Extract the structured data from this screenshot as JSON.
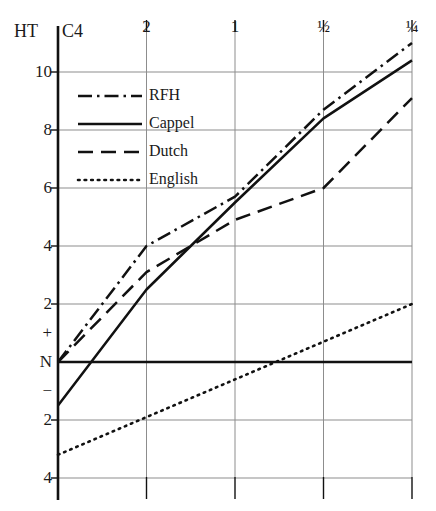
{
  "axes": {
    "y_axis_corner_label": "HT",
    "x_axis_corner_label": "C4",
    "y_ticks": [
      "10",
      "8",
      "6",
      "4",
      "2",
      "+",
      "N",
      "−",
      "2",
      "4"
    ],
    "x_ticks": [
      "2",
      "1",
      "½",
      "¼"
    ],
    "baseline_label": "N"
  },
  "legend": {
    "items": [
      {
        "label": "RFH",
        "style": "dashdot",
        "color": "#111111"
      },
      {
        "label": "Cappel",
        "style": "solid",
        "color": "#111111"
      },
      {
        "label": "Dutch",
        "style": "dashed",
        "color": "#111111"
      },
      {
        "label": "English",
        "style": "dotted",
        "color": "#111111"
      }
    ]
  },
  "chart_data": {
    "type": "line",
    "title": "",
    "subtitle": "",
    "xlabel": "C4",
    "ylabel": "HT",
    "x": [
      "C4",
      "2",
      "1",
      "½",
      "¼"
    ],
    "x_tick_labels": [
      "C4",
      "2",
      "1",
      "½",
      "¼"
    ],
    "y_tick_labels": [
      "10",
      "8",
      "6",
      "4",
      "2",
      "+",
      "N",
      "−",
      "2",
      "4"
    ],
    "ylim": [
      -4,
      11.5
    ],
    "xlim": [
      0,
      4
    ],
    "grid": true,
    "legend_position": "upper-left-inside",
    "baseline_value": 0,
    "baseline_label": "N",
    "series": [
      {
        "name": "RFH",
        "style": "dashdot",
        "values": [
          0.0,
          4.0,
          5.7,
          8.7,
          11.0
        ]
      },
      {
        "name": "Cappel",
        "style": "solid",
        "values": [
          -1.5,
          2.5,
          5.5,
          8.4,
          10.4
        ]
      },
      {
        "name": "Dutch",
        "style": "dashed",
        "values": [
          0.0,
          3.1,
          4.9,
          6.0,
          9.1
        ]
      },
      {
        "name": "English",
        "style": "dotted",
        "values": [
          -3.2,
          -1.9,
          -0.6,
          0.7,
          2.0
        ]
      }
    ]
  }
}
